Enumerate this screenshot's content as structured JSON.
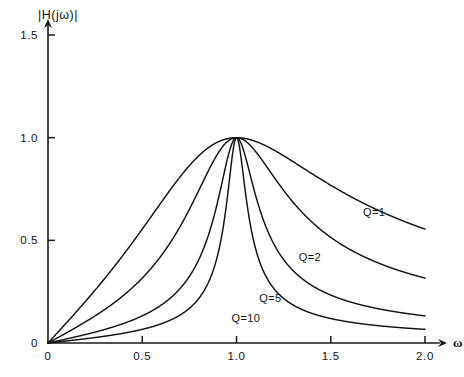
{
  "chart_data": {
    "type": "line",
    "title": "|H(jω)|",
    "xlabel": "ω",
    "ylabel": "|H(jω)|",
    "xlim": [
      0,
      2.0
    ],
    "ylim": [
      0,
      1.5
    ],
    "grid": false,
    "legend_position": "inline-annotations",
    "x_ticks": [
      {
        "value": 0,
        "label": "0"
      },
      {
        "value": 0.5,
        "label": "0.5"
      },
      {
        "value": 1.0,
        "label": "1.0"
      },
      {
        "value": 1.5,
        "label": "1.5"
      },
      {
        "value": 2.0,
        "label": "2.0"
      }
    ],
    "y_ticks": [
      {
        "value": 0,
        "label": "0"
      },
      {
        "value": 0.5,
        "label": "0.5"
      },
      {
        "value": 1.0,
        "label": "1.0"
      },
      {
        "value": 1.5,
        "label": "1.5"
      }
    ],
    "function": "bandpass-magnitude",
    "formula": "1 / sqrt(1 + Q^2 * (w - 1/w)^2)",
    "series": [
      {
        "name": "Q=1",
        "q": 1,
        "label": "Q=1",
        "label_x": 1.73,
        "label_y": 0.62,
        "x": [
          0.0,
          0.1,
          0.2,
          0.3,
          0.4,
          0.5,
          0.6,
          0.7,
          0.8,
          0.9,
          1.0,
          1.1,
          1.2,
          1.3,
          1.4,
          1.5,
          1.6,
          1.7,
          1.8,
          1.9,
          2.0
        ],
        "values": [
          0.0,
          0.1,
          0.2,
          0.3,
          0.39,
          0.47,
          0.55,
          0.63,
          0.74,
          0.88,
          1.0,
          0.88,
          0.77,
          0.68,
          0.61,
          0.55,
          0.5,
          0.46,
          0.43,
          0.4,
          0.37
        ]
      },
      {
        "name": "Q=2",
        "q": 2,
        "label": "Q=2",
        "label_x": 1.39,
        "label_y": 0.4,
        "x": [
          0.0,
          0.1,
          0.2,
          0.3,
          0.4,
          0.5,
          0.6,
          0.7,
          0.8,
          0.9,
          1.0,
          1.1,
          1.2,
          1.3,
          1.4,
          1.5,
          1.6,
          1.7,
          1.8,
          1.9,
          2.0
        ],
        "values": [
          0.0,
          0.05,
          0.1,
          0.16,
          0.21,
          0.28,
          0.35,
          0.44,
          0.58,
          0.79,
          1.0,
          0.79,
          0.59,
          0.45,
          0.36,
          0.3,
          0.26,
          0.23,
          0.2,
          0.18,
          0.17
        ]
      },
      {
        "name": "Q=5",
        "q": 5,
        "label": "Q=5",
        "label_x": 1.18,
        "label_y": 0.2,
        "x": [
          0.0,
          0.1,
          0.2,
          0.3,
          0.4,
          0.5,
          0.6,
          0.7,
          0.8,
          0.9,
          1.0,
          1.1,
          1.2,
          1.3,
          1.4,
          1.5,
          1.6,
          1.7,
          1.8,
          1.9,
          2.0
        ],
        "values": [
          0.0,
          0.02,
          0.04,
          0.07,
          0.09,
          0.13,
          0.16,
          0.21,
          0.3,
          0.51,
          1.0,
          0.51,
          0.3,
          0.21,
          0.16,
          0.13,
          0.11,
          0.09,
          0.08,
          0.07,
          0.07
        ]
      },
      {
        "name": "Q=10",
        "q": 10,
        "label": "Q=10",
        "label_x": 1.05,
        "label_y": 0.1,
        "x": [
          0.0,
          0.1,
          0.2,
          0.3,
          0.4,
          0.5,
          0.6,
          0.7,
          0.8,
          0.9,
          1.0,
          1.1,
          1.2,
          1.3,
          1.4,
          1.5,
          1.6,
          1.7,
          1.8,
          1.9,
          2.0
        ],
        "values": [
          0.0,
          0.01,
          0.02,
          0.03,
          0.05,
          0.07,
          0.08,
          0.11,
          0.16,
          0.3,
          1.0,
          0.3,
          0.16,
          0.11,
          0.08,
          0.07,
          0.06,
          0.05,
          0.04,
          0.04,
          0.03
        ]
      }
    ],
    "colors": {
      "curve": "#111111",
      "axis": "#1a1a1a",
      "text": "#121212",
      "background": "#ffffff"
    }
  }
}
